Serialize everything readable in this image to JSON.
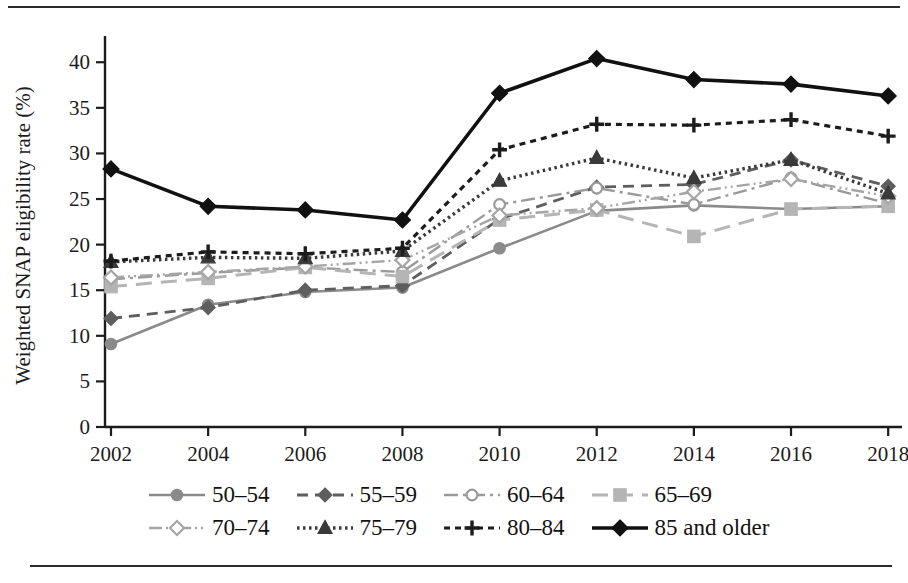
{
  "figure": {
    "has_top_rule": true,
    "has_bottom_rule": true
  },
  "axes": {
    "ylabel": "Weighted SNAP eligibility rate (%)",
    "xlabel": "",
    "yticks": [
      "0",
      "5",
      "10",
      "15",
      "20",
      "25",
      "30",
      "35",
      "40"
    ],
    "xticks": [
      "2002",
      "2004",
      "2006",
      "2008",
      "2010",
      "2012",
      "2014",
      "2016",
      "2018"
    ]
  },
  "legend": {
    "rows": [
      [
        {
          "label": "50–54",
          "key": "50-54"
        },
        {
          "label": "55–59",
          "key": "55-59"
        },
        {
          "label": "60–64",
          "key": "60-64"
        },
        {
          "label": "65–69",
          "key": "65-69"
        }
      ],
      [
        {
          "label": "70–74",
          "key": "70-74"
        },
        {
          "label": "75–79",
          "key": "75-79"
        },
        {
          "label": "80–84",
          "key": "80-84"
        },
        {
          "label": "85 and older",
          "key": "85+"
        }
      ]
    ]
  },
  "colors": {
    "series_50_54": "#8a8a8a",
    "series_55_59": "#5e5e5e",
    "series_60_64": "#9a9a9a",
    "series_65_69": "#b5b5b5",
    "series_70_74": "#a5a5a5",
    "series_75_79": "#3a3a3a",
    "series_80_84": "#1c1c1c",
    "series_85_plus": "#111111",
    "axis": "#1b1b1b",
    "background": "#ffffff"
  },
  "chart_data": {
    "type": "line",
    "title": "",
    "xlabel": "",
    "ylabel": "Weighted SNAP eligibility rate (%)",
    "x": [
      2002,
      2004,
      2006,
      2008,
      2010,
      2012,
      2014,
      2016,
      2018
    ],
    "xlim": [
      2001,
      2019
    ],
    "ylim": [
      0,
      42
    ],
    "yticks": [
      0,
      5,
      10,
      15,
      20,
      25,
      30,
      35,
      40
    ],
    "grid": false,
    "legend_position": "below",
    "series": [
      {
        "name": "50–54",
        "marker": "circle",
        "dash": "solid",
        "color": "#8a8a8a",
        "values": [
          9.1,
          13.4,
          14.8,
          15.3,
          19.6,
          23.7,
          24.3,
          23.9,
          24.2
        ]
      },
      {
        "name": "55–59",
        "marker": "diamond",
        "dash": "dashed",
        "color": "#5e5e5e",
        "values": [
          11.9,
          13.1,
          15.0,
          15.5,
          22.8,
          26.3,
          26.6,
          29.3,
          26.4
        ]
      },
      {
        "name": "60–64",
        "marker": "open-circle",
        "dash": "dashdot",
        "color": "#9a9a9a",
        "values": [
          16.2,
          16.9,
          17.5,
          17.0,
          24.4,
          26.2,
          24.4,
          27.3,
          24.5
        ]
      },
      {
        "name": "65–69",
        "marker": "square",
        "dash": "longdash",
        "color": "#b5b5b5",
        "values": [
          15.4,
          16.3,
          17.5,
          16.5,
          22.7,
          23.8,
          20.9,
          23.9,
          24.2
        ]
      },
      {
        "name": "70–74",
        "marker": "open-diamond",
        "dash": "dashdotdot",
        "color": "#a5a5a5",
        "values": [
          16.4,
          17.0,
          17.6,
          18.3,
          23.2,
          24.0,
          25.8,
          27.2,
          25.3
        ]
      },
      {
        "name": "75–79",
        "marker": "triangle",
        "dash": "dotted",
        "color": "#3a3a3a",
        "values": [
          18.1,
          18.6,
          18.5,
          19.3,
          27.0,
          29.5,
          27.3,
          29.3,
          25.6
        ]
      },
      {
        "name": "80–84",
        "marker": "plus",
        "dash": "fine-dashed",
        "color": "#1c1c1c",
        "values": [
          18.2,
          19.2,
          19.0,
          19.6,
          30.4,
          33.2,
          33.1,
          33.7,
          31.9
        ]
      },
      {
        "name": "85 and older",
        "marker": "filled-diamond",
        "dash": "solid-thick",
        "color": "#111111",
        "values": [
          28.3,
          24.2,
          23.8,
          22.7,
          36.6,
          40.4,
          38.1,
          37.6,
          36.3
        ]
      }
    ]
  }
}
